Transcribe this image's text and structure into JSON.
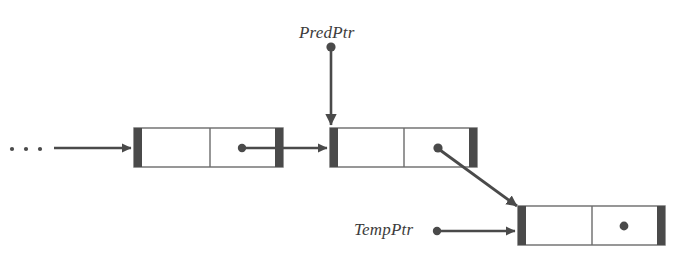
{
  "figure": {
    "background_color": "#ffffff",
    "ink_color": "#4a4a4a",
    "box_fill": "#ffffff",
    "bar_color": "#4a4a4a",
    "text_color": "#3c3c3c",
    "width": 675,
    "height": 261
  },
  "labels": {
    "pred_ptr": "PredPtr",
    "temp_ptr": "TempPtr",
    "ellipsis": "· · ·"
  },
  "top_crumbs": {
    "crumb_a": "·",
    "crumb_b": "·"
  },
  "nodes": [
    {
      "id": "node-1",
      "name": "predecessor-node",
      "x": 134,
      "y": 128,
      "width": 149,
      "height": 39,
      "data_cell_label": "",
      "link_cell_label": "",
      "has_link_dot": true,
      "link_dot_x": 242,
      "link_dot_y": 148
    },
    {
      "id": "node-2",
      "name": "current-node",
      "x": 330,
      "y": 128,
      "width": 147,
      "height": 39,
      "data_cell_label": "",
      "link_cell_label": "",
      "has_link_dot": true,
      "link_dot_x": 438,
      "link_dot_y": 148
    },
    {
      "id": "node-3",
      "name": "new-node",
      "x": 518,
      "y": 206,
      "width": 147,
      "height": 39,
      "data_cell_label": "",
      "link_cell_label": "",
      "has_link_dot": true,
      "link_dot_x": 624,
      "link_dot_y": 226
    }
  ],
  "connectors": [
    {
      "name": "ellipsis-to-node1",
      "type": "horizontal-arrow",
      "from_x": 48,
      "from_y": 148,
      "to_x": 133,
      "to_y": 148,
      "has_source_dot": false
    },
    {
      "name": "node1-link-to-node2",
      "type": "horizontal-arrow",
      "from_x": 242,
      "from_y": 148,
      "to_x": 329,
      "to_y": 148,
      "has_source_dot": true
    },
    {
      "name": "predptr-to-node2",
      "type": "vertical-arrow",
      "from_x": 331,
      "from_y": 47,
      "to_x": 331,
      "to_y": 127,
      "has_source_dot": true
    },
    {
      "name": "node2-link-to-node3",
      "type": "diagonal-arrow",
      "from_x": 438,
      "from_y": 148,
      "to_x": 519,
      "to_y": 207,
      "has_source_dot": true
    },
    {
      "name": "tempptr-to-node3",
      "type": "horizontal-arrow",
      "from_x": 437,
      "from_y": 231,
      "to_x": 517,
      "to_y": 231,
      "has_source_dot": true
    }
  ],
  "ellipsis_marker": {
    "name": "list-continues-ellipsis",
    "x": 12,
    "y": 148,
    "dot_count": 3,
    "dot_spacing": 14
  }
}
